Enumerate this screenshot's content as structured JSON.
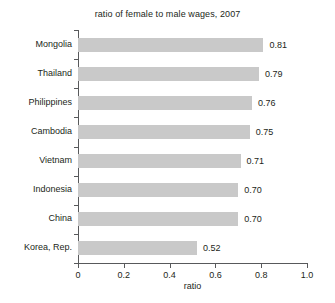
{
  "chart_data": {
    "type": "bar",
    "orientation": "horizontal",
    "title": "ratio of female to male wages, 2007",
    "xlabel": "ratio",
    "ylabel": "",
    "xlim": [
      0,
      1.0
    ],
    "grid": false,
    "legend": null,
    "categories": [
      "Mongolia",
      "Thailand",
      "Philippines",
      "Cambodia",
      "Vietnam",
      "Indonesia",
      "China",
      "Korea, Rep."
    ],
    "values": [
      0.81,
      0.79,
      0.76,
      0.75,
      0.71,
      0.7,
      0.7,
      0.52
    ],
    "value_labels": [
      "0.81",
      "0.79",
      "0.76",
      "0.75",
      "0.71",
      "0.70",
      "0.70",
      "0.52"
    ],
    "xticks": [
      0,
      0.2,
      0.4,
      0.6,
      0.8,
      1.0
    ],
    "xtick_labels": [
      "0",
      "0.2",
      "0.4",
      "0.6",
      "0.8",
      "1.0"
    ],
    "colors": {
      "bar": "#c9c9c9",
      "axis": "#58595b",
      "text": "#231f20",
      "background": "#ffffff"
    }
  }
}
